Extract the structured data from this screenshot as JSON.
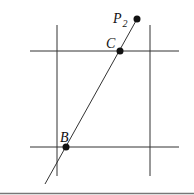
{
  "diagram": {
    "colors": {
      "line": "#333333",
      "point": "#111111",
      "border": "#777777"
    },
    "grid": {
      "vertical_lines": [
        {
          "x": 57,
          "y1": 25,
          "y2": 176
        },
        {
          "x": 150,
          "y1": 25,
          "y2": 176
        }
      ],
      "horizontal_lines": [
        {
          "y": 51,
          "x1": 30,
          "x2": 179
        },
        {
          "y": 147,
          "x1": 30,
          "x2": 179
        }
      ]
    },
    "segment": {
      "x1": 45,
      "y1": 184,
      "x2": 137,
      "y2": 19
    },
    "points": [
      {
        "id": "P2",
        "label": "P",
        "subscript": "2",
        "x": 137,
        "y": 19
      },
      {
        "id": "C",
        "label": "C",
        "subscript": "",
        "x": 120,
        "y": 51
      },
      {
        "id": "B",
        "label": "B",
        "subscript": "",
        "x": 66,
        "y": 147
      }
    ],
    "labels": {
      "p2_main": "P",
      "p2_sub": "2",
      "c": "C",
      "b": "B"
    }
  }
}
